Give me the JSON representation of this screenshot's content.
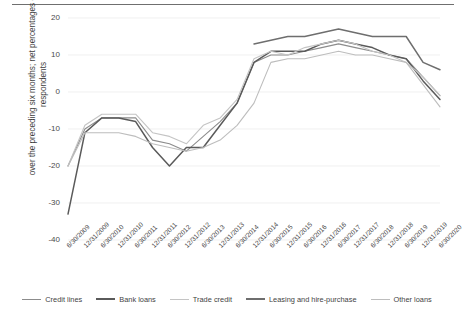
{
  "chart_data": {
    "type": "line",
    "title": "",
    "xlabel": "",
    "ylabel": "over the preceding six months; net percentages of respondents",
    "ylim": [
      -40,
      20
    ],
    "yticks": [
      20,
      10,
      0,
      -10,
      -20,
      -30,
      -40
    ],
    "grid": true,
    "legend_position": "bottom",
    "categories": [
      "6/30/2009",
      "12/31/2009",
      "6/30/2010",
      "12/31/2010",
      "6/30/2011",
      "12/31/2011",
      "6/30/2012",
      "12/31/2012",
      "6/30/2013",
      "12/31/2013",
      "6/30/2014",
      "12/31/2014",
      "6/30/2015",
      "12/31/2015",
      "6/30/2016",
      "12/31/2016",
      "6/30/2017",
      "12/31/2017",
      "6/30/2018",
      "12/31/2018",
      "6/30/2019",
      "12/31/2019",
      "6/30/2020"
    ],
    "series": [
      {
        "name": "Credit lines",
        "color": "#8c8c8c",
        "values": [
          -20,
          -10,
          -7,
          -7,
          -7,
          -13,
          -14,
          -16,
          -12,
          -8,
          -3,
          8,
          10,
          10,
          11,
          12,
          13,
          12,
          11,
          10,
          9,
          4,
          -1
        ]
      },
      {
        "name": "Bank loans",
        "color": "#5a5a5a",
        "values": [
          -33,
          -11,
          -7,
          -7,
          -8,
          -15,
          -20,
          -15,
          -15,
          -9,
          -3,
          8,
          11,
          11,
          11,
          13,
          14,
          13,
          12,
          10,
          9,
          3,
          -2
        ]
      },
      {
        "name": "Trade credit",
        "color": "#c4c4c4",
        "values": [
          -20,
          -9,
          -6,
          -6,
          -6,
          -11,
          -12,
          -14,
          -9,
          -7,
          -2,
          9,
          11,
          10,
          12,
          13,
          14,
          13,
          11,
          10,
          8,
          4,
          -1
        ]
      },
      {
        "name": "Leasing and hire-purchase",
        "color": "#6e6e6e",
        "values": [
          null,
          null,
          null,
          null,
          null,
          null,
          null,
          null,
          null,
          null,
          null,
          13,
          14,
          15,
          15,
          16,
          17,
          16,
          15,
          15,
          15,
          8,
          6
        ]
      },
      {
        "name": "Other loans",
        "color": "#bdbdbd",
        "values": [
          -20,
          -11,
          -11,
          -11,
          -12,
          -14,
          -15,
          -16,
          -15,
          -13,
          -9,
          -3,
          8,
          9,
          9,
          10,
          11,
          10,
          10,
          9,
          8,
          2,
          -4
        ]
      }
    ]
  },
  "legend": {
    "items": [
      {
        "label": "Credit lines"
      },
      {
        "label": "Bank loans"
      },
      {
        "label": "Trade credit"
      },
      {
        "label": "Leasing and hire-purchase"
      },
      {
        "label": "Other loans"
      }
    ]
  },
  "axis": {
    "y_title": "over the preceding six months; net percentages of\nrespondents"
  }
}
